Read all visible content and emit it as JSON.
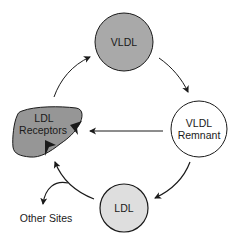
{
  "diagram": {
    "type": "cycle",
    "nodes": {
      "vldl": {
        "label": "VLDL",
        "fill": "#a9a9a9"
      },
      "vldl_remnant": {
        "line1": "VLDL",
        "line2": "Remnant",
        "fill": "#ffffff"
      },
      "ldl": {
        "label": "LDL",
        "fill": "#dedede"
      },
      "ldl_receptors": {
        "line1": "LDL",
        "line2": "Receptors",
        "fill": "#969696"
      },
      "other_sites": {
        "label": "Other Sites"
      }
    },
    "edges": [
      {
        "from": "ldl_receptors",
        "to": "vldl"
      },
      {
        "from": "vldl",
        "to": "vldl_remnant"
      },
      {
        "from": "vldl_remnant",
        "to": "ldl_receptors"
      },
      {
        "from": "vldl_remnant",
        "to": "ldl"
      },
      {
        "from": "ldl",
        "to": "ldl_receptors"
      },
      {
        "from": "ldl",
        "to": "other_sites"
      }
    ],
    "colors": {
      "stroke": "#1a1a1a",
      "text": "#1a1a1a"
    }
  }
}
